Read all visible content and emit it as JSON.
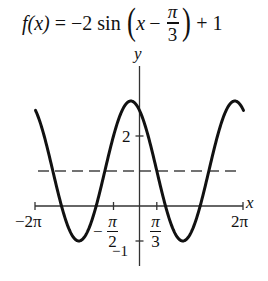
{
  "title": {
    "lhs": "f(x)",
    "equals": "=",
    "coef": "−2 sin",
    "inner_var": "x",
    "minus": "−",
    "frac_num": "π",
    "frac_den": "3",
    "plus": "+ 1",
    "paren_open": "(",
    "paren_close": ")"
  },
  "axes": {
    "x_label": "x",
    "y_label": "y",
    "x_tick_left": "−2π",
    "x_tick_right": "2π",
    "x_tick_neg_half_pi": {
      "sign": "−",
      "num": "π",
      "den": "2"
    },
    "x_tick_pi_third": {
      "num": "π",
      "den": "3"
    },
    "y_tick_2": "2",
    "y_tick_neg1": "−1"
  },
  "chart_data": {
    "type": "line",
    "function": {
      "A": -2,
      "B": 1,
      "C": 1.0471975512,
      "D": 1
    },
    "xlabel": "x",
    "ylabel": "y",
    "xlim": [
      -6.2832,
      6.2832
    ],
    "ylim": [
      -1.7,
      4.0
    ],
    "x_ticks": [
      {
        "value": -6.2832,
        "label": "−2π"
      },
      {
        "value": -1.5708,
        "label": "−π/2"
      },
      {
        "value": 1.0472,
        "label": "π/3"
      },
      {
        "value": 6.2832,
        "label": "2π"
      }
    ],
    "y_ticks": [
      {
        "value": 2,
        "label": "2"
      },
      {
        "value": -1,
        "label": "−1"
      }
    ],
    "midline": {
      "y": 1,
      "style": "dashed"
    },
    "key_points": {
      "maxima": [
        [
          -0.5236,
          3
        ],
        [
          5.7596,
          3
        ]
      ],
      "minima": [
        [
          -3.6652,
          -1
        ],
        [
          2.618,
          -1
        ]
      ],
      "endpoints": [
        [
          -6.2832,
          2.732
        ],
        [
          6.2832,
          2.732
        ]
      ]
    },
    "grid": false,
    "legend": null
  },
  "layout": {
    "origin_px": [
      139.5,
      206
    ],
    "px_per_x_unit": 16.55,
    "px_per_y_unit": 35,
    "curve_color": "#111111",
    "axis_color": "#333333",
    "dash_color": "#444444"
  }
}
